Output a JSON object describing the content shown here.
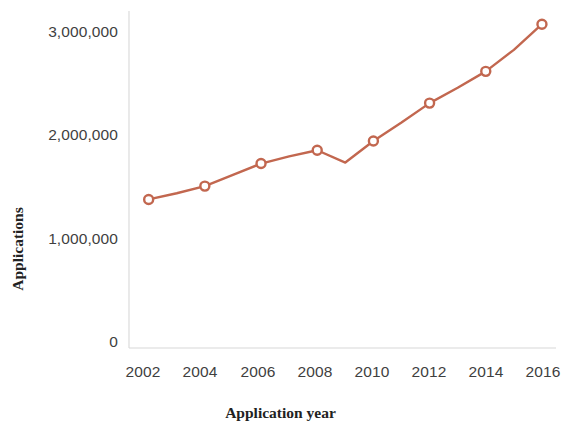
{
  "chart_data": {
    "type": "line",
    "title": "",
    "xlabel": "Application year",
    "ylabel": "Applications",
    "x": [
      2002,
      2003,
      2004,
      2005,
      2006,
      2007,
      2008,
      2009,
      2010,
      2011,
      2012,
      2013,
      2014,
      2015,
      2016
    ],
    "values": [
      1450000,
      1510000,
      1580000,
      1690000,
      1800000,
      1870000,
      1930000,
      1810000,
      2020000,
      2200000,
      2390000,
      2540000,
      2700000,
      2910000,
      3160000
    ],
    "marker_x": [
      2002,
      2004,
      2006,
      2008,
      2010,
      2012,
      2014,
      2016
    ],
    "marker_values": [
      1450000,
      1580000,
      1800000,
      1930000,
      2020000,
      2390000,
      2700000,
      3160000
    ],
    "xlim": [
      2001.3,
      2016.5
    ],
    "ylim": [
      0,
      3250000
    ],
    "xticks": [
      2002,
      2004,
      2006,
      2008,
      2010,
      2012,
      2014,
      2016
    ],
    "xtick_labels": [
      "2002",
      "2004",
      "2006",
      "2008",
      "2010",
      "2012",
      "2014",
      "2016"
    ],
    "yticks": [
      0,
      1000000,
      2000000,
      3000000
    ],
    "ytick_labels": [
      "0",
      "1,000,000",
      "2,000,000",
      "3,000,000"
    ],
    "grid": false,
    "legend": null,
    "series_color": "#c2674f",
    "marker_face_color": "#ffffff",
    "axis_color": "#d8d8d8",
    "tick_label_color": "#3f3f3f",
    "line_width": 2.4,
    "marker_style": "circle",
    "marker_size": 9
  }
}
